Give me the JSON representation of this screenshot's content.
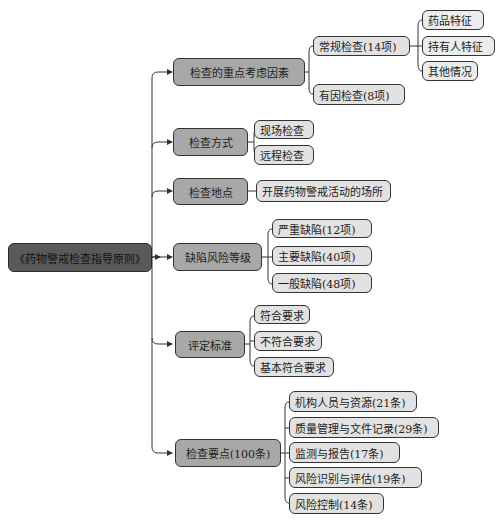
{
  "root": {
    "label": "《药物警戒检查指导原则》"
  },
  "branches": [
    {
      "label": "检查的重点考虑因素",
      "children": [
        {
          "label": "常规检查(14项)",
          "children": [
            {
              "label": "药品特征"
            },
            {
              "label": "持有人特征"
            },
            {
              "label": "其他情况"
            }
          ]
        },
        {
          "label": "有因检查(8项)"
        }
      ]
    },
    {
      "label": "检查方式",
      "children": [
        {
          "label": "现场检查"
        },
        {
          "label": "远程检查"
        }
      ]
    },
    {
      "label": "检查地点",
      "children": [
        {
          "label": "开展药物警戒活动的场所"
        }
      ]
    },
    {
      "label": "缺陷风险等级",
      "children": [
        {
          "label": "严重缺陷(12项)"
        },
        {
          "label": "主要缺陷(40项)"
        },
        {
          "label": "一般缺陷(48项)"
        }
      ]
    },
    {
      "label": "评定标准",
      "children": [
        {
          "label": "符合要求"
        },
        {
          "label": "不符合要求"
        },
        {
          "label": "基本符合要求"
        }
      ]
    },
    {
      "label": "检查要点(100条)",
      "children": [
        {
          "label": "机构人员与资源(21条)"
        },
        {
          "label": "质量管理与文件记录(29条)"
        },
        {
          "label": "监测与报告(17条)"
        },
        {
          "label": "风险识别与评估(19条)"
        },
        {
          "label": "风险控制(14条)"
        }
      ]
    }
  ],
  "colors": {
    "root_fill": "#5a5a5a",
    "level1_fill": "#a8a8a8",
    "level2_fill": "#e2e2e2",
    "line": "#333333"
  }
}
